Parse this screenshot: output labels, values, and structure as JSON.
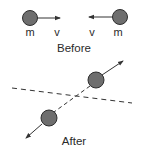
{
  "diagram": {
    "colors": {
      "ball_fill": "#6e6e6e",
      "ball_stroke": "#2e2e2e",
      "line": "#333333",
      "text": "#2a2a2a",
      "background": "#ffffff"
    },
    "before": {
      "caption": "Before",
      "left_ball": {
        "mass_label": "m",
        "velocity_label": "v",
        "direction": "right"
      },
      "right_ball": {
        "mass_label": "m",
        "velocity_label": "v",
        "direction": "left"
      }
    },
    "after": {
      "caption": "After",
      "upper_ball": {
        "direction": "up-right"
      },
      "lower_ball": {
        "direction": "down-left"
      },
      "reference_line": "dashed"
    }
  }
}
